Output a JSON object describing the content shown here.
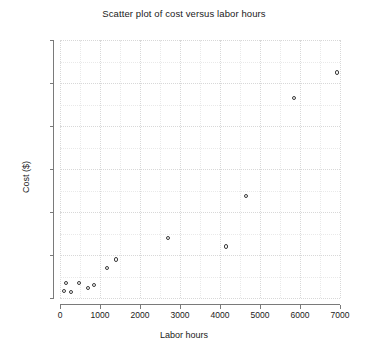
{
  "chart_data": {
    "type": "scatter",
    "title": "Scatter plot of cost versus labor hours",
    "xlabel": "Labor hours",
    "ylabel": "Cost ($)",
    "xlim": [
      0,
      7000
    ],
    "ylim": [
      0,
      6000
    ],
    "xticks": [
      0,
      1000,
      2000,
      3000,
      4000,
      5000,
      6000,
      7000
    ],
    "yticks": [
      0,
      1000,
      2000,
      3000,
      4000,
      5000,
      6000
    ],
    "xtick_labels": [
      "0",
      "1000",
      "2000",
      "3000",
      "4000",
      "5000",
      "6000",
      "7000"
    ],
    "ytick_labels": [
      "0",
      "1000",
      "2000",
      "3000",
      "4000",
      "5000",
      "6000"
    ],
    "grid": true,
    "grid_minor_step_x": 500,
    "grid_minor_step_y": 500,
    "legend": null,
    "marker": "open-circle",
    "marker_color": "#3a3a3a",
    "x": [
      100,
      150,
      275,
      475,
      700,
      850,
      1175,
      1400,
      2700,
      4150,
      4650,
      5850,
      6925
    ],
    "y": [
      160,
      350,
      140,
      350,
      230,
      300,
      700,
      900,
      1400,
      1200,
      2375,
      4650,
      5250
    ],
    "points": [
      {
        "x": 100,
        "y": 160
      },
      {
        "x": 150,
        "y": 350
      },
      {
        "x": 275,
        "y": 140
      },
      {
        "x": 475,
        "y": 350
      },
      {
        "x": 700,
        "y": 230
      },
      {
        "x": 850,
        "y": 300
      },
      {
        "x": 1175,
        "y": 700
      },
      {
        "x": 1400,
        "y": 900
      },
      {
        "x": 2700,
        "y": 1400
      },
      {
        "x": 4150,
        "y": 1200
      },
      {
        "x": 4650,
        "y": 2375
      },
      {
        "x": 5850,
        "y": 4650
      },
      {
        "x": 6925,
        "y": 5250
      }
    ]
  },
  "colors": {
    "background": "#ffffff",
    "axis": "#7a7a7a",
    "text": "#1a1a1a",
    "grid_major": "#d8d8d8",
    "grid_minor": "#e9e9e9",
    "marker": "#3a3a3a"
  }
}
